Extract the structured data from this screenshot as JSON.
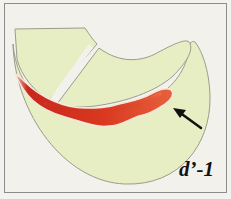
{
  "figure": {
    "label": "d’-1",
    "colors": {
      "background": "#f3f1ec",
      "tissue": "#e8eec4",
      "tissue_outline": "#9a9c8c",
      "lesion_dark": "#c8281c",
      "lesion_light": "#e85a3a",
      "arrow": "#111111",
      "frame": "#8c8c8c"
    },
    "annotations": [
      {
        "type": "arrow",
        "target": "lesion-tip"
      }
    ]
  }
}
